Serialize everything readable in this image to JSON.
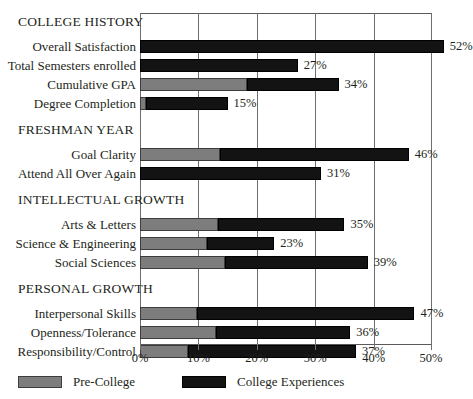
{
  "chart_data": {
    "type": "bar",
    "orientation": "horizontal",
    "stacked": true,
    "title": "",
    "xlabel": "",
    "ylabel": "",
    "xlim": [
      0,
      50
    ],
    "xticks": [
      0,
      10,
      20,
      30,
      40,
      50
    ],
    "xtick_labels": [
      "0%",
      "10%",
      "20%",
      "30%",
      "40%",
      "50%"
    ],
    "grid": true,
    "legend_position": "bottom",
    "series": [
      {
        "name": "Pre-College",
        "color": "#7d7d7d"
      },
      {
        "name": "College Experiences",
        "color": "#131313"
      }
    ],
    "groups": [
      {
        "label": "COLLEGE HISTORY",
        "rows": [
          {
            "label": "Overall Satisfaction",
            "pre_college": 0.0,
            "college_experiences": 52.0,
            "total": 52,
            "value_label": "52%"
          },
          {
            "label": "Total Semesters enrolled",
            "pre_college": 0.0,
            "college_experiences": 27.0,
            "total": 27,
            "value_label": "27%"
          },
          {
            "label": "Cumulative GPA",
            "pre_college": 18.3,
            "college_experiences": 15.7,
            "total": 34,
            "value_label": "34%"
          },
          {
            "label": "Degree Completion",
            "pre_college": 1.0,
            "college_experiences": 14.0,
            "total": 15,
            "value_label": "15%"
          }
        ]
      },
      {
        "label": "FRESHMAN YEAR",
        "rows": [
          {
            "label": "Goal Clarity",
            "pre_college": 13.7,
            "college_experiences": 32.3,
            "total": 46,
            "value_label": "46%"
          },
          {
            "label": "Attend All Over Again",
            "pre_college": 0.0,
            "college_experiences": 31.0,
            "total": 31,
            "value_label": "31%"
          }
        ]
      },
      {
        "label": "INTELLECTUAL GROWTH",
        "rows": [
          {
            "label": "Arts & Letters",
            "pre_college": 13.4,
            "college_experiences": 21.6,
            "total": 35,
            "value_label": "35%"
          },
          {
            "label": "Science & Engineering",
            "pre_college": 11.5,
            "college_experiences": 11.5,
            "total": 23,
            "value_label": "23%"
          },
          {
            "label": "Social Sciences",
            "pre_college": 14.5,
            "college_experiences": 24.5,
            "total": 39,
            "value_label": "39%"
          }
        ]
      },
      {
        "label": "PERSONAL GROWTH",
        "rows": [
          {
            "label": "Interpersonal Skills",
            "pre_college": 9.8,
            "college_experiences": 37.2,
            "total": 47,
            "value_label": "47%"
          },
          {
            "label": "Openness/Tolerance",
            "pre_college": 13.0,
            "college_experiences": 23.0,
            "total": 36,
            "value_label": "36%"
          },
          {
            "label": "Responsibility/Control",
            "pre_college": 8.2,
            "college_experiences": 28.8,
            "total": 37,
            "value_label": "37%"
          }
        ]
      }
    ]
  },
  "legend": {
    "items": [
      {
        "label": "Pre-College",
        "swatch": "pre"
      },
      {
        "label": "College Experiences",
        "swatch": "col"
      }
    ]
  }
}
